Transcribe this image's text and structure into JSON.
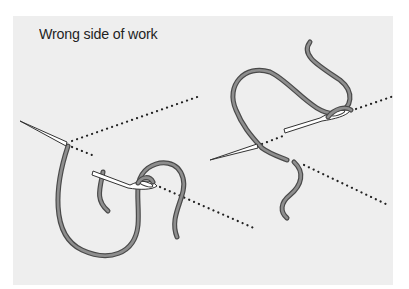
{
  "figure": {
    "caption": "Wrong side of work",
    "colors": {
      "panel_background": "#eeeeee",
      "page_background": "#ffffff",
      "thread_fill": "#8e8e8e",
      "thread_outline": "#4a4a4a",
      "needle_fill": "#ffffff",
      "needle_outline": "#333333",
      "dotted_line": "#222222",
      "caption_text": "#1f1f1f"
    },
    "illustrations": [
      {
        "name": "left-stitch",
        "description": "Needle passing under fabric with thread looped around needle eye"
      },
      {
        "name": "right-stitch",
        "description": "Needle threaded, thread wrapping over the needle eye"
      }
    ]
  }
}
